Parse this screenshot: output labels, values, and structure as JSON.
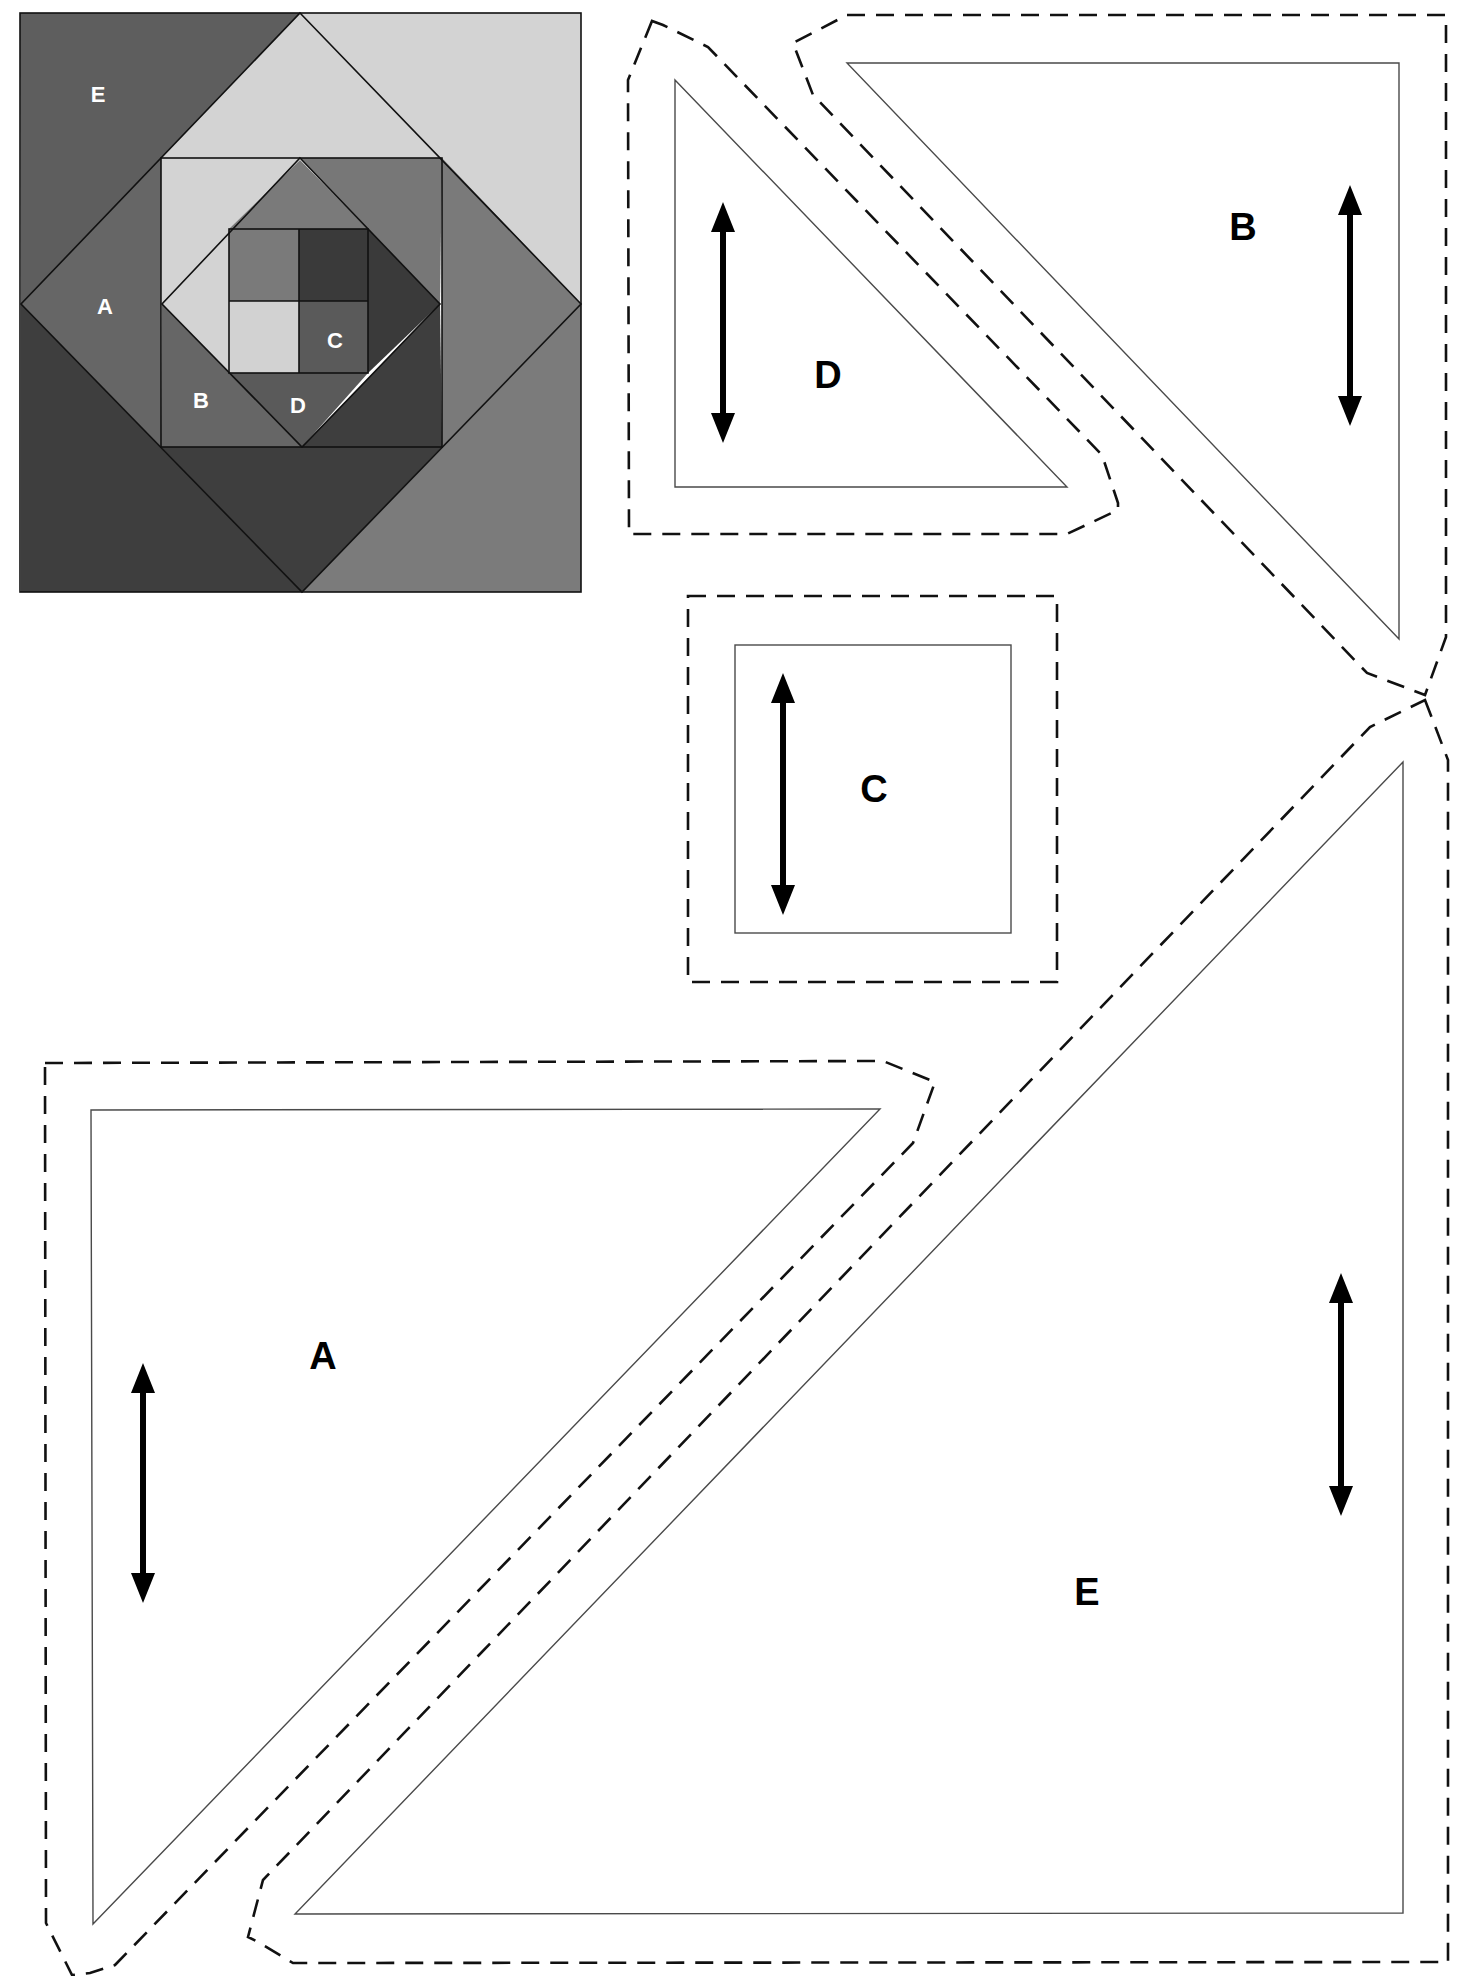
{
  "quilt_block": {
    "labels": {
      "E": "E",
      "A": "A",
      "B": "B",
      "C": "C",
      "D": "D"
    },
    "colors": {
      "outer_top_left": "#5e5e5e",
      "outer_top_right": "#d3d3d3",
      "outer_bottom_left": "#3e3e3e",
      "outer_bottom_right": "#7b7b7b",
      "diamond_top_left": "#d3d3d3",
      "diamond_top_right": "#7a7a7a",
      "diamond_bottom_left": "#666666",
      "diamond_bottom_right": "#3e3e3e",
      "inner_tl": "#d3d3d3",
      "inner_tr": "#777777",
      "inner_bl": "#666666",
      "inner_br": "#3e3e3e",
      "inner_diamond_top": "#7a7a7a",
      "inner_diamond_left": "#d3d3d3",
      "inner_diamond_right": "#3a3a3a",
      "inner_diamond_bottom": "#5a5a5a",
      "center_tl": "#7a7a7a",
      "center_tr": "#3a3a3a",
      "center_bl": "#d2d2d2",
      "center_br": "#5a5a5a"
    }
  },
  "templates": [
    {
      "id": "D",
      "label": "D",
      "shape": "right-triangle",
      "grain": "vertical"
    },
    {
      "id": "B",
      "label": "B",
      "shape": "right-triangle",
      "grain": "vertical"
    },
    {
      "id": "C",
      "label": "C",
      "shape": "square",
      "grain": "vertical"
    },
    {
      "id": "A",
      "label": "A",
      "shape": "right-triangle",
      "grain": "vertical"
    },
    {
      "id": "E",
      "label": "E",
      "shape": "right-triangle",
      "grain": "vertical"
    }
  ],
  "legend": {
    "solid_line": "finished sewing line",
    "dashed_line": "cutting line (seam allowance)",
    "arrow": "grain line"
  }
}
